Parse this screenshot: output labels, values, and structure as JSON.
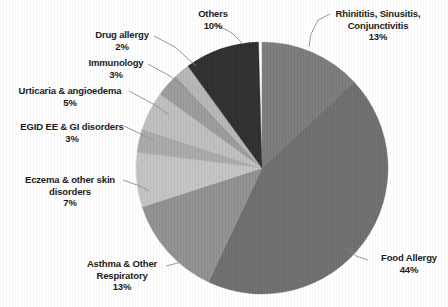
{
  "chart_data": {
    "type": "pie",
    "title": "",
    "subtitle": "",
    "xlabel": "",
    "ylabel": "",
    "legend_position": "none",
    "grid": false,
    "labels_outside": true,
    "leader_lines": true,
    "start_angle_deg": 0,
    "direction": "clockwise",
    "categories": [
      "Rhinititis, Sinusitis, Conjunctivitis",
      "Food Allergy",
      "Asthma & Other Respiratory",
      "Eczema & other skin disorders",
      "EGID EE & GI disorders",
      "Urticaria & angioedema",
      "Immunology",
      "Drug allergy",
      "Others"
    ],
    "values": [
      13,
      44,
      13,
      7,
      3,
      5,
      3,
      2,
      10
    ],
    "value_labels": [
      "13%",
      "44%",
      "13%",
      "7%",
      "3%",
      "5%",
      "3%",
      "2%",
      "10%"
    ],
    "colors": [
      "#7b7b7b",
      "#6e6e6e",
      "#909090",
      "#c3c3c3",
      "#a9a9a9",
      "#bebebe",
      "#9b9b9b",
      "#b6b6b6",
      "#2e2e2e"
    ],
    "slices": [
      {
        "name": "Rhinititis, Sinusitis, Conjunctivitis",
        "label_line1": "Rhinititis, Sinusitis,",
        "label_line2": "Conjunctivitis",
        "value": 13,
        "pct": "13%",
        "color": "#7b7b7b"
      },
      {
        "name": "Food Allergy",
        "label_line1": "Food Allergy",
        "label_line2": "",
        "value": 44,
        "pct": "44%",
        "color": "#6e6e6e"
      },
      {
        "name": "Asthma & Other Respiratory",
        "label_line1": "Asthma & Other",
        "label_line2": "Respiratory",
        "value": 13,
        "pct": "13%",
        "color": "#909090"
      },
      {
        "name": "Eczema & other skin disorders",
        "label_line1": "Eczema & other skin",
        "label_line2": "disorders",
        "value": 7,
        "pct": "7%",
        "color": "#c3c3c3"
      },
      {
        "name": "EGID EE & GI disorders",
        "label_line1": "EGID EE & GI disorders",
        "label_line2": "",
        "value": 3,
        "pct": "3%",
        "color": "#a9a9a9"
      },
      {
        "name": "Urticaria & angioedema",
        "label_line1": "Urticaria & angioedema",
        "label_line2": "",
        "value": 5,
        "pct": "5%",
        "color": "#bebebe"
      },
      {
        "name": "Immunology",
        "label_line1": "Immunology",
        "label_line2": "",
        "value": 3,
        "pct": "3%",
        "color": "#9b9b9b"
      },
      {
        "name": "Drug allergy",
        "label_line1": "Drug allergy",
        "label_line2": "",
        "value": 2,
        "pct": "2%",
        "color": "#b6b6b6"
      },
      {
        "name": "Others",
        "label_line1": "Others",
        "label_line2": "",
        "value": 10,
        "pct": "10%",
        "color": "#2e2e2e"
      }
    ]
  },
  "labels": {
    "others": {
      "name": "Others",
      "pct": "10%"
    },
    "rhinitis": {
      "line1": "Rhinititis, Sinusitis,",
      "line2": "Conjunctivitis",
      "pct": "13%"
    },
    "drug_allergy": {
      "name": "Drug allergy",
      "pct": "2%"
    },
    "immunology": {
      "name": "Immunology",
      "pct": "3%"
    },
    "urticaria": {
      "name": "Urticaria & angioedema",
      "pct": "5%"
    },
    "egid": {
      "name": "EGID EE & GI disorders",
      "pct": "3%"
    },
    "eczema": {
      "line1": "Eczema & other skin",
      "line2": "disorders",
      "pct": "7%"
    },
    "asthma": {
      "line1": "Asthma & Other",
      "line2": "Respiratory",
      "pct": "13%"
    },
    "food_allergy": {
      "name": "Food Allergy",
      "pct": "44%"
    }
  },
  "style": {
    "background": "#ffffff",
    "text_color": "#1b1b1b",
    "leader_line_color": "#8d8d8d",
    "gap_color": "#ffffff"
  }
}
